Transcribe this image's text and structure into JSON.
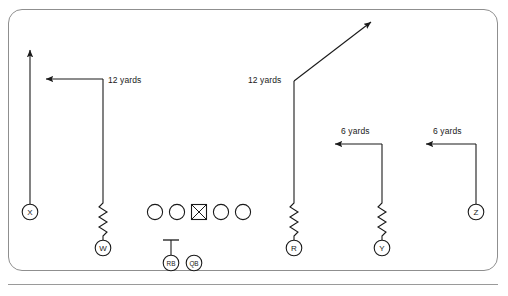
{
  "diagram": {
    "type": "football-play-diagram",
    "title": "",
    "line_color": "#1a1a1a",
    "border_color": "#8f8f8f",
    "background": "#ffffff"
  },
  "labels": [
    {
      "id": "w-depth",
      "text": "12 yards",
      "x": 108,
      "y": 76
    },
    {
      "id": "r-depth",
      "text": "12 yards",
      "x": 248,
      "y": 76
    },
    {
      "id": "y-depth",
      "text": "6 yards",
      "x": 341,
      "y": 127
    },
    {
      "id": "z-depth",
      "text": "6 yards",
      "x": 433,
      "y": 127
    }
  ],
  "players": [
    {
      "id": "X",
      "label": "X",
      "x": 30,
      "y": 212,
      "shape": "circle",
      "r": 8
    },
    {
      "id": "W",
      "label": "W",
      "x": 103,
      "y": 248,
      "shape": "circle",
      "r": 8
    },
    {
      "id": "R",
      "label": "R",
      "x": 294,
      "y": 248,
      "shape": "circle",
      "r": 8
    },
    {
      "id": "Y",
      "label": "Y",
      "x": 382,
      "y": 248,
      "shape": "circle",
      "r": 8
    },
    {
      "id": "Z",
      "label": "Z",
      "x": 476,
      "y": 212,
      "shape": "circle",
      "r": 8
    },
    {
      "id": "RB",
      "label": "RB",
      "x": 171,
      "y": 263,
      "shape": "circle",
      "r": 8
    },
    {
      "id": "QB",
      "label": "QB",
      "x": 194,
      "y": 263,
      "shape": "circle",
      "r": 8
    }
  ],
  "line_of_scrimmage": {
    "linemen": [
      {
        "id": "LT",
        "x": 155,
        "y": 212,
        "shape": "circle",
        "r": 8
      },
      {
        "id": "LG",
        "x": 177,
        "y": 212,
        "shape": "circle",
        "r": 8
      },
      {
        "id": "C",
        "x": 199,
        "y": 212,
        "shape": "boxed-x",
        "size": 15
      },
      {
        "id": "RG",
        "x": 221,
        "y": 212,
        "shape": "circle",
        "r": 8
      },
      {
        "id": "RT",
        "x": 243,
        "y": 212,
        "shape": "circle",
        "r": 8
      }
    ]
  },
  "routes": [
    {
      "id": "X-route",
      "player": "X",
      "name": "go",
      "depth_yards": null,
      "arrow": "up"
    },
    {
      "id": "W-route",
      "player": "W",
      "name": "dig",
      "depth_yards": 12,
      "arrow": "left",
      "release": "zigzag"
    },
    {
      "id": "R-route",
      "player": "R",
      "name": "corner",
      "depth_yards": 12,
      "arrow": "up-right",
      "release": "zigzag"
    },
    {
      "id": "Y-route",
      "player": "Y",
      "name": "in",
      "depth_yards": 6,
      "arrow": "left",
      "release": "zigzag"
    },
    {
      "id": "Z-route",
      "player": "Z",
      "name": "in",
      "depth_yards": 6,
      "arrow": "left",
      "release": "straight"
    },
    {
      "id": "RB-block",
      "player": "RB",
      "name": "block",
      "depth_yards": null,
      "arrow": "block-t"
    }
  ]
}
